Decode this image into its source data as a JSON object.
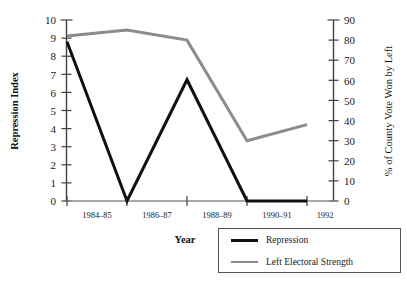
{
  "chart_data": {
    "type": "line",
    "title": "",
    "xlabel": "Year",
    "ylabel": "Repression Index",
    "y2label": "% of County Vote Won by Left",
    "categories": [
      "1984–85",
      "1986–87",
      "1988–89",
      "1990–91",
      "1992"
    ],
    "ylim": [
      0,
      10
    ],
    "y2lim": [
      0,
      90
    ],
    "yticks": [
      "10",
      "9",
      "8",
      "7",
      "6",
      "5",
      "4",
      "3",
      "2",
      "1",
      "0"
    ],
    "y2ticks": [
      "90",
      "80",
      "70",
      "60",
      "50",
      "40",
      "30",
      "20",
      "10",
      "0"
    ],
    "grid": false,
    "legend_position": "bottom-right",
    "series": [
      {
        "name": "Repression",
        "axis": "left",
        "color": "#111111",
        "values": [
          8.8,
          0.0,
          6.7,
          0.0,
          0.0
        ]
      },
      {
        "name": "Left Electoral Strength",
        "axis": "right",
        "color": "#8c8c8c",
        "values": [
          82,
          85,
          80,
          30,
          38
        ]
      }
    ]
  },
  "legend": {
    "items": [
      {
        "label": "Repression",
        "swatch": "thick"
      },
      {
        "label": "Left Electoral Strength",
        "swatch": "thin"
      }
    ]
  }
}
